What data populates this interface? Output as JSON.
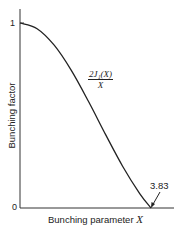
{
  "chart_data": {
    "type": "line",
    "title": "",
    "xlabel": "Bunching parameter X",
    "ylabel": "Bunching factor",
    "xlim": [
      0,
      3.83
    ],
    "ylim": [
      0,
      1
    ],
    "y_ticks": [
      "0",
      "1"
    ],
    "annotations": [
      {
        "text": "2J1(X)/X",
        "role": "curve-label"
      },
      {
        "text": "3.83",
        "role": "x-intercept-marker"
      }
    ],
    "series": [
      {
        "name": "2J1(X)/X",
        "x": [
          0,
          0.5,
          1.0,
          1.5,
          2.0,
          2.5,
          3.0,
          3.5,
          3.83
        ],
        "values": [
          1.0,
          0.969,
          0.88,
          0.744,
          0.577,
          0.398,
          0.226,
          0.078,
          0.0
        ]
      }
    ],
    "grid": false,
    "legend": "none"
  },
  "labels": {
    "y_axis": "Bunching factor",
    "x_axis_text": "Bunching parameter ",
    "x_axis_var": "X",
    "y_tick_top": "1",
    "y_tick_bottom": "0",
    "intercept": "3.83",
    "formula_num": "2J₁(X)",
    "formula_den": "X"
  }
}
